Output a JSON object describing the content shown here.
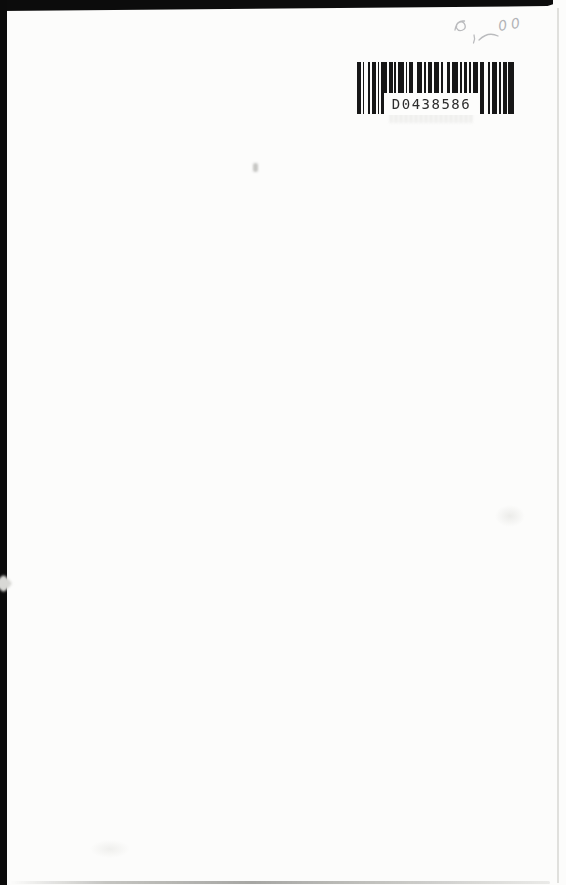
{
  "document": {
    "kind": "scanned book page, mostly blank",
    "page_background": "#fcfcfb",
    "scan_border_color": "#0b0b0b",
    "page_edge_color": "#dbdad7"
  },
  "barcode": {
    "label": "D0438586",
    "color": "#171717",
    "pattern": [
      2,
      1,
      1,
      2,
      1,
      1,
      2,
      1,
      1,
      1,
      3,
      1,
      2,
      1,
      1,
      1,
      3,
      1,
      1,
      1,
      2,
      2,
      3,
      1,
      1,
      1,
      2,
      1,
      3,
      1,
      1,
      2,
      2,
      1,
      3,
      1,
      1,
      1,
      2,
      1,
      1,
      1,
      3,
      1,
      2,
      2,
      1,
      1,
      3,
      1,
      1,
      1,
      2,
      1,
      3
    ]
  },
  "pencil_note": {
    "digits": "00",
    "color": "#b3b4b7",
    "description": "faint handwritten pencil price marks above barcode"
  }
}
